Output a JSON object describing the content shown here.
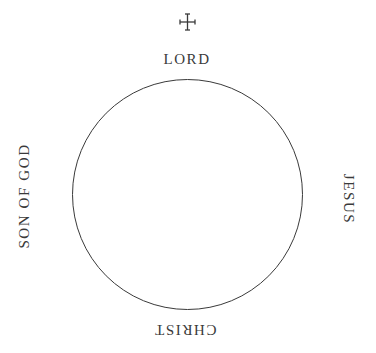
{
  "diagram": {
    "type": "circle-with-cardinal-labels",
    "top_icon": "cross-icon",
    "labels": {
      "top": "LORD",
      "right": "JESUS",
      "bottom": "CHRIST",
      "left": "SON OF GOD"
    },
    "colors": {
      "stroke": "#3a3a3a",
      "text": "#3a3a3a",
      "background": "#ffffff"
    }
  }
}
